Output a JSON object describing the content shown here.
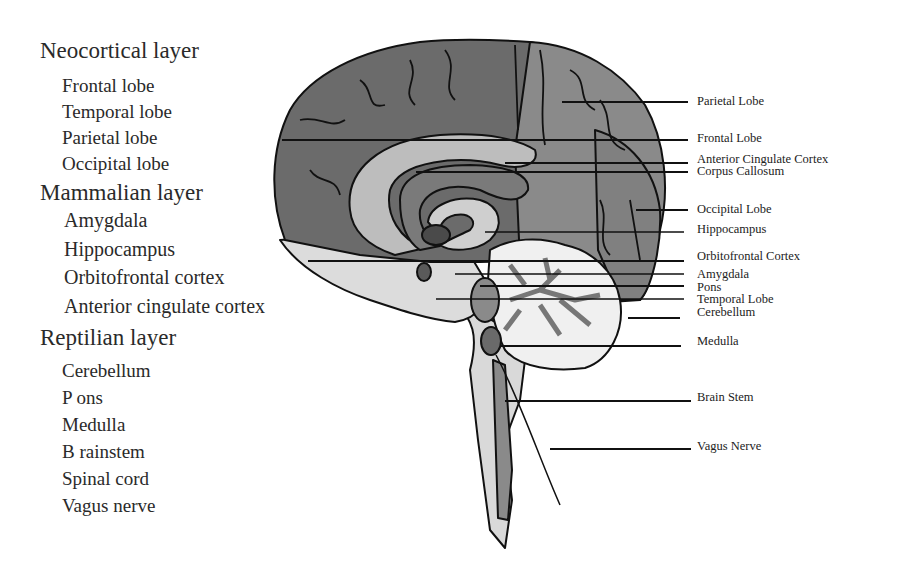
{
  "legend": {
    "groups": [
      {
        "title": "Neocortical layer",
        "items": [
          "Frontal lobe",
          "Temporal lobe",
          "Parietal lobe",
          "Occipital lobe"
        ]
      },
      {
        "title": "Mammalian layer",
        "items": [
          "Amygdala",
          "Hippocampus",
          "Orbitofrontal cortex",
          "Anterior cingulate cortex"
        ]
      },
      {
        "title": "Reptilian layer",
        "items": [
          "Cerebellum",
          "P ons",
          "Medulla",
          "B rainstem",
          "Spinal cord",
          "Vagus nerve"
        ]
      }
    ]
  },
  "diagram": {
    "labels": [
      {
        "text": "Parietal Lobe",
        "y": 101
      },
      {
        "text": "Frontal Lobe",
        "y": 138
      },
      {
        "text": "Anterior Cingulate Cortex",
        "y": 159
      },
      {
        "text": "Corpus Callosum",
        "y": 171
      },
      {
        "text": "Occipital Lobe",
        "y": 209
      },
      {
        "text": "Hippocampus",
        "y": 229
      },
      {
        "text": "Orbitofrontal Cortex",
        "y": 256
      },
      {
        "text": "Amygdala",
        "y": 274
      },
      {
        "text": "Pons",
        "y": 287
      },
      {
        "text": "Temporal Lobe",
        "y": 299
      },
      {
        "text": "Cerebellum",
        "y": 312
      },
      {
        "text": "Medulla",
        "y": 341
      },
      {
        "text": "Brain Stem",
        "y": 397
      },
      {
        "text": "Vagus Nerve",
        "y": 446
      }
    ],
    "colors": {
      "frontal": "#6b6b6b",
      "parietal": "#8a8a8a",
      "limbic_light": "#bdbdbd",
      "cingulate": "#7a7a7a",
      "amygdala": "#4a4a4a",
      "temporal": "#dcdcdc",
      "brainstem": "#d9d9d9",
      "cerebellum_white": "#f0f0f0",
      "outline": "#111111"
    }
  }
}
